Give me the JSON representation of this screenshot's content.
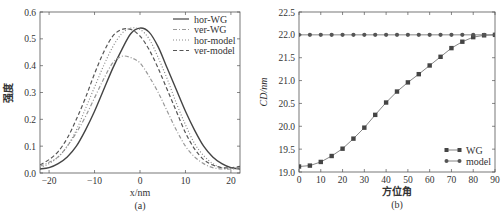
{
  "chart_data": [
    {
      "panel": "(a)",
      "type": "line",
      "title": "",
      "xlabel": "x/nm",
      "ylabel": "强度",
      "xlim": [
        -22,
        22
      ],
      "ylim": [
        0.0,
        0.6
      ],
      "xticks": [
        "-20",
        "-10",
        "0",
        "10",
        "20"
      ],
      "yticks": [
        "0.0",
        "0.1",
        "0.2",
        "0.3",
        "0.4",
        "0.5",
        "0.6"
      ],
      "legend_position": "upper right",
      "grid": false,
      "series": [
        {
          "name": "hor-WG",
          "style": "solid",
          "x": [
            -22,
            -20,
            -18,
            -16,
            -14,
            -12,
            -10,
            -8,
            -6,
            -4,
            -2,
            0,
            2,
            4,
            6,
            8,
            10,
            12,
            14,
            16,
            18,
            20,
            22
          ],
          "y": [
            0.015,
            0.02,
            0.035,
            0.06,
            0.1,
            0.16,
            0.23,
            0.31,
            0.39,
            0.46,
            0.52,
            0.54,
            0.525,
            0.47,
            0.39,
            0.31,
            0.23,
            0.16,
            0.1,
            0.06,
            0.035,
            0.02,
            0.015
          ]
        },
        {
          "name": "ver-WG",
          "style": "dashdot",
          "x": [
            -22,
            -20,
            -18,
            -16,
            -14,
            -12,
            -10,
            -8,
            -6,
            -4,
            -2,
            0,
            2,
            4,
            6,
            8,
            10,
            12,
            14,
            16,
            18,
            20,
            22
          ],
          "y": [
            0.025,
            0.04,
            0.06,
            0.1,
            0.15,
            0.21,
            0.28,
            0.35,
            0.41,
            0.435,
            0.43,
            0.41,
            0.36,
            0.3,
            0.23,
            0.16,
            0.1,
            0.06,
            0.035,
            0.02,
            0.015,
            0.015,
            0.02
          ]
        },
        {
          "name": "hor-model",
          "style": "dotted",
          "x": [
            -22,
            -20,
            -18,
            -16,
            -14,
            -12,
            -10,
            -8,
            -6,
            -4,
            -2,
            0,
            2,
            4,
            6,
            8,
            10,
            12,
            14,
            16,
            18,
            20,
            22
          ],
          "y": [
            0.02,
            0.035,
            0.06,
            0.1,
            0.16,
            0.24,
            0.32,
            0.4,
            0.47,
            0.52,
            0.54,
            0.535,
            0.5,
            0.43,
            0.35,
            0.26,
            0.18,
            0.11,
            0.065,
            0.035,
            0.02,
            0.015,
            0.02
          ]
        },
        {
          "name": "ver-model",
          "style": "dashed",
          "x": [
            -22,
            -20,
            -18,
            -16,
            -14,
            -12,
            -10,
            -8,
            -6,
            -4,
            -2,
            0,
            2,
            4,
            6,
            8,
            10,
            12,
            14,
            16,
            18,
            20,
            22
          ],
          "y": [
            0.03,
            0.05,
            0.08,
            0.13,
            0.2,
            0.28,
            0.37,
            0.45,
            0.51,
            0.535,
            0.535,
            0.51,
            0.46,
            0.39,
            0.31,
            0.23,
            0.15,
            0.09,
            0.05,
            0.03,
            0.02,
            0.02,
            0.025
          ]
        }
      ]
    },
    {
      "panel": "(b)",
      "type": "line",
      "title": "",
      "xlabel": "方位角",
      "ylabel": "CD/nm",
      "xlim": [
        0,
        90
      ],
      "ylim": [
        19.0,
        22.5
      ],
      "xticks": [
        "0",
        "10",
        "20",
        "30",
        "40",
        "50",
        "60",
        "70",
        "80",
        "90"
      ],
      "yticks": [
        "19.0",
        "19.5",
        "20.0",
        "20.5",
        "21.0",
        "21.5",
        "22.0",
        "22.5"
      ],
      "legend_position": "lower right",
      "grid": false,
      "series": [
        {
          "name": "WG",
          "marker": "square",
          "x": [
            0,
            5,
            10,
            15,
            20,
            25,
            30,
            35,
            40,
            45,
            50,
            55,
            60,
            65,
            70,
            75,
            80,
            85,
            90
          ],
          "y": [
            19.12,
            19.14,
            19.22,
            19.35,
            19.51,
            19.73,
            19.97,
            20.25,
            20.52,
            20.76,
            20.96,
            21.14,
            21.33,
            21.52,
            21.71,
            21.85,
            21.95,
            21.99,
            22.0
          ]
        },
        {
          "name": "model",
          "marker": "circle",
          "x": [
            0,
            5,
            10,
            15,
            20,
            25,
            30,
            35,
            40,
            45,
            50,
            55,
            60,
            65,
            70,
            75,
            80,
            85,
            90
          ],
          "y": [
            22.0,
            22.0,
            22.0,
            22.0,
            22.0,
            22.0,
            22.0,
            22.0,
            22.0,
            22.0,
            22.0,
            22.0,
            22.0,
            22.0,
            22.0,
            22.0,
            22.0,
            22.0,
            22.0
          ]
        }
      ]
    }
  ]
}
